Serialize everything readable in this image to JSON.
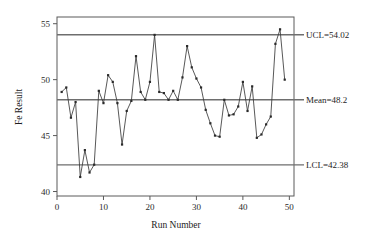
{
  "chart_data": {
    "type": "line",
    "title": "",
    "subtitle": "",
    "xlabel": "Run Number",
    "ylabel": "Fe Result",
    "xlim": [
      0,
      51
    ],
    "ylim": [
      39.6,
      55.6
    ],
    "xticks": [
      0,
      10,
      20,
      30,
      40,
      50
    ],
    "yticks": [
      40,
      45,
      50,
      55
    ],
    "grid": false,
    "legend": null,
    "x": [
      1,
      2,
      3,
      4,
      5,
      6,
      7,
      8,
      9,
      10,
      11,
      12,
      13,
      14,
      15,
      16,
      17,
      18,
      19,
      20,
      21,
      22,
      23,
      24,
      25,
      26,
      27,
      28,
      29,
      30,
      31,
      32,
      33,
      34,
      35,
      36,
      37,
      38,
      39,
      40,
      41,
      42,
      43,
      44,
      45,
      46,
      47,
      48,
      49
    ],
    "series": [
      {
        "name": "Fe Result",
        "values": [
          48.9,
          49.3,
          46.6,
          48.0,
          41.3,
          43.7,
          41.7,
          42.4,
          49.0,
          47.9,
          50.4,
          49.8,
          47.9,
          44.2,
          47.2,
          48.1,
          52.1,
          48.9,
          48.2,
          49.8,
          54.0,
          48.9,
          48.8,
          48.2,
          49.0,
          48.2,
          50.2,
          53.0,
          51.1,
          50.1,
          49.3,
          47.3,
          46.1,
          45.0,
          44.9,
          48.2,
          46.8,
          46.9,
          47.6,
          49.8,
          47.2,
          49.4,
          44.8,
          45.1,
          46.0,
          46.7,
          53.2,
          54.5,
          50.0
        ]
      }
    ],
    "control_lines": [
      {
        "id": "ucl",
        "label": "UCL=54.02",
        "value": 54.02
      },
      {
        "id": "mean",
        "label": "Mean=48.2",
        "value": 48.2
      },
      {
        "id": "lcl",
        "label": "LCL=42.38",
        "value": 42.38
      }
    ]
  }
}
